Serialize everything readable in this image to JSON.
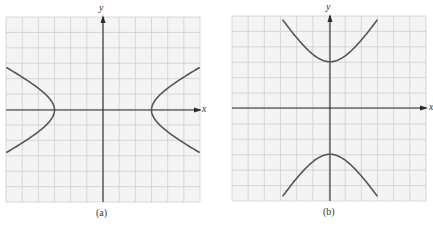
{
  "figures": [
    {
      "id": "a",
      "caption": "(a)",
      "x_axis_label": "x",
      "y_axis_label": "y",
      "orientation": "horizontal",
      "grid_cells": 12,
      "vertex_distance_cells": 3,
      "grid": {
        "left": 6,
        "top": 17,
        "right": 200,
        "bottom": 202
      },
      "origin": {
        "x": 103,
        "y": 110
      },
      "conj_axis_cells": 1.6,
      "extent_cells": 5.95
    },
    {
      "id": "b",
      "caption": "(b)",
      "x_axis_label": "x",
      "y_axis_label": "y",
      "orientation": "vertical",
      "grid_cells": 12,
      "vertex_distance_cells": 3,
      "grid": {
        "left": 232,
        "top": 16,
        "right": 426,
        "bottom": 201
      },
      "origin": {
        "x": 330,
        "y": 108
      },
      "conj_axis_cells": 1.8,
      "extent_cells": 5.7
    }
  ],
  "colors": {
    "grid": "#cfcfcf",
    "grid_bg": "#f4f4f4",
    "axis": "#2a2a2a",
    "curve": "#555555"
  }
}
